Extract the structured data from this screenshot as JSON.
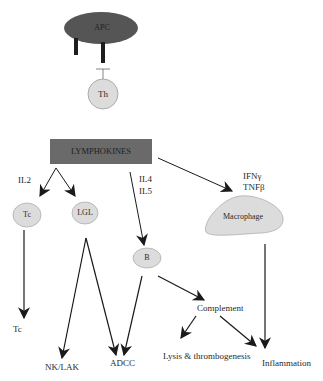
{
  "diagram": {
    "colors": {
      "apc_fill": "#555555",
      "receptor_fill": "#1e1e1e",
      "cell_fill": "#dcdcdc",
      "cell_stroke": "#9a9a9a",
      "lymphokines_fill": "#6a6a6a",
      "arrow": "#1a1a1a",
      "text": "#2a2a2a"
    },
    "nodes": {
      "apc": "APC",
      "th": "Th",
      "lymphokines": "LYMPHOKINES",
      "tc": "Tc",
      "lgl": "LGL",
      "b": "B",
      "macrophage": "Macrophage"
    },
    "edge_labels": {
      "il2": "IL2",
      "il4": "IL4",
      "il5": "IL5",
      "ifn": "IFNγ",
      "tnf": "TNFβ"
    },
    "outcomes": {
      "tc": "Tc",
      "nk_lak": "NK/LAK",
      "adcc": "ADCC",
      "complement": "Complement",
      "lysis": "Lysis & thrombogenesis",
      "inflammation": "Inflammation"
    }
  }
}
